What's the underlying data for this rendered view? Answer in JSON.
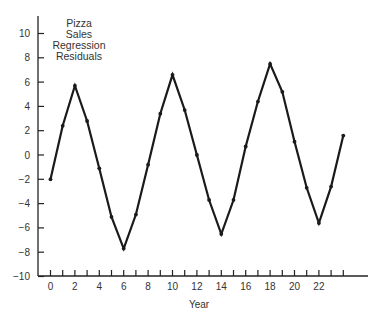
{
  "chart_data": {
    "type": "line",
    "title_lines": [
      "Pizza",
      "Sales",
      "Regression",
      "Residuals"
    ],
    "xlabel": "Year",
    "ylabel": "",
    "x": [
      0,
      1,
      2,
      3,
      4,
      5,
      6,
      7,
      8,
      9,
      10,
      11,
      12,
      13,
      14,
      15,
      16,
      17,
      18,
      19,
      20,
      21,
      22,
      23,
      24
    ],
    "series": [
      {
        "name": "Residuals",
        "values": [
          -2.0,
          2.4,
          5.7,
          2.8,
          -1.1,
          -5.1,
          -7.7,
          -4.9,
          -0.8,
          3.4,
          6.6,
          3.7,
          0.0,
          -3.7,
          -6.5,
          -3.7,
          0.7,
          4.4,
          7.5,
          5.2,
          1.1,
          -2.7,
          -5.6,
          -2.6,
          1.6
        ]
      }
    ],
    "xlim": [
      0,
      26
    ],
    "ylim": [
      -10,
      10
    ],
    "x_tick_labels": [
      "0",
      "2",
      "4",
      "6",
      "8",
      "10",
      "12",
      "14",
      "16",
      "18",
      "20",
      "22"
    ],
    "y_tick_labels": [
      "10",
      "8",
      "6",
      "4",
      "2",
      "0",
      "-2",
      "-4",
      "-6",
      "-8",
      "-10"
    ],
    "grid": false,
    "legend": "none",
    "line_color": "#1a1a1a"
  }
}
